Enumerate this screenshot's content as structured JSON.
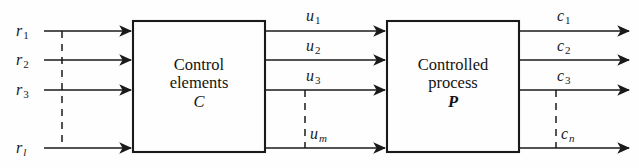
{
  "figure": {
    "kind": "block-diagram",
    "background_color": "#fefefe",
    "line_color": "#1a1a1a",
    "text_color": "#141414"
  },
  "blocks": [
    {
      "id": "control-elements",
      "line1": "Control",
      "line2": "elements",
      "symbol": "C",
      "symbol_style": "italic",
      "x": 133,
      "y": 21,
      "width": 132,
      "height": 131
    },
    {
      "id": "controlled-process",
      "line1": "Controlled",
      "line2": "process",
      "symbol": "P",
      "symbol_style": "bold-italic",
      "x": 387,
      "y": 21,
      "width": 132,
      "height": 131
    }
  ],
  "inputs": {
    "group_name": "reference-inputs",
    "label_position": "left-inline",
    "signals": [
      {
        "base": "r",
        "sub": "1",
        "sub_italic": false,
        "row": 1
      },
      {
        "base": "r",
        "sub": "2",
        "sub_italic": false,
        "row": 2
      },
      {
        "base": "r",
        "sub": "3",
        "sub_italic": false,
        "row": 3
      },
      {
        "base": "r",
        "sub": "l",
        "sub_italic": true,
        "row": 4
      }
    ]
  },
  "intermediate": {
    "group_name": "control-signals",
    "label_position": "above-line",
    "signals": [
      {
        "base": "u",
        "sub": "1",
        "sub_italic": false,
        "row": 1
      },
      {
        "base": "u",
        "sub": "2",
        "sub_italic": false,
        "row": 2
      },
      {
        "base": "u",
        "sub": "3",
        "sub_italic": false,
        "row": 3
      },
      {
        "base": "u",
        "sub": "m",
        "sub_italic": true,
        "row": 4
      }
    ]
  },
  "outputs": {
    "group_name": "controlled-outputs",
    "label_position": "above-line",
    "signals": [
      {
        "base": "c",
        "sub": "1",
        "sub_italic": false,
        "row": 1
      },
      {
        "base": "c",
        "sub": "2",
        "sub_italic": false,
        "row": 2
      },
      {
        "base": "c",
        "sub": "3",
        "sub_italic": false,
        "row": 3
      },
      {
        "base": "c",
        "sub": "n",
        "sub_italic": true,
        "row": 4
      }
    ]
  },
  "geometry": {
    "rows_y": [
      31,
      60,
      90,
      148
    ],
    "ellipsis_note": "vertical dashed line indicates omitted intermediate signals between row 3 and row 4",
    "dashed_x": {
      "inputs": 62,
      "intermediate": 305,
      "outputs": 556
    }
  }
}
